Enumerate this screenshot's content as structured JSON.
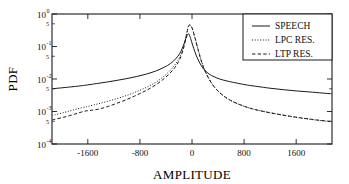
{
  "chart_data": {
    "type": "line",
    "title": "",
    "xlabel": "AMPLITUDE",
    "ylabel": "PDF",
    "yscale": "log",
    "xlim": [
      -2150,
      2150
    ],
    "ylim": [
      0.0001,
      1.0
    ],
    "grid": false,
    "legend_position": "top-right",
    "xticks": [
      -1600,
      -800,
      0,
      800,
      1600
    ],
    "xticklabels": [
      "-1600",
      "-800",
      "0",
      "800",
      "1600"
    ],
    "yticks": [
      1,
      0.5,
      0.1,
      0.05,
      0.01,
      0.005,
      0.001,
      0.0005,
      0.0001
    ],
    "yticklabels": [
      "10^0",
      "5",
      "10^-1",
      "5",
      "10^-2",
      "5",
      "10^-3",
      "5",
      "10^-4"
    ],
    "ytick_majors": [
      {
        "mantissa": "10",
        "exponent": "0",
        "value": 1
      },
      {
        "mantissa": "10",
        "exponent": "-1",
        "value": 0.1
      },
      {
        "mantissa": "10",
        "exponent": "-2",
        "value": 0.01
      },
      {
        "mantissa": "10",
        "exponent": "-3",
        "value": 0.001
      },
      {
        "mantissa": "10",
        "exponent": "-4",
        "value": 0.0001
      }
    ],
    "ytick_minors": [
      {
        "label": "5",
        "value": 0.5
      },
      {
        "label": "5",
        "value": 0.05
      },
      {
        "label": "5",
        "value": 0.005
      },
      {
        "label": "5",
        "value": 0.0005
      }
    ],
    "series": [
      {
        "name": "SPEECH",
        "style": "solid",
        "color": "#1a1a1a",
        "x": [
          -2150,
          -1900,
          -1700,
          -1600,
          -1450,
          -1300,
          -1150,
          -1000,
          -850,
          -700,
          -560,
          -430,
          -330,
          -250,
          -190,
          -150,
          -120,
          -95,
          -75,
          -60,
          -45,
          -20,
          10,
          45,
          80,
          120,
          170,
          230,
          300,
          380,
          470,
          580,
          700,
          850,
          1000,
          1200,
          1400,
          1600,
          1800,
          2000,
          2150
        ],
        "y": [
          0.005,
          0.0056,
          0.0062,
          0.0066,
          0.0073,
          0.0081,
          0.0091,
          0.0103,
          0.0119,
          0.0142,
          0.0175,
          0.0228,
          0.03,
          0.042,
          0.06,
          0.087,
          0.125,
          0.175,
          0.22,
          0.245,
          0.235,
          0.175,
          0.11,
          0.068,
          0.045,
          0.031,
          0.0215,
          0.016,
          0.0128,
          0.0108,
          0.0094,
          0.0083,
          0.0074,
          0.0065,
          0.0059,
          0.0052,
          0.0047,
          0.0043,
          0.004,
          0.0037,
          0.0035
        ]
      },
      {
        "name": "LPC RES.",
        "style": "dotted",
        "color": "#1a1a1a",
        "x": [
          -2150,
          -1950,
          -1800,
          -1700,
          -1620,
          -1560,
          -1450,
          -1320,
          -1180,
          -1050,
          -920,
          -800,
          -680,
          -570,
          -470,
          -380,
          -300,
          -230,
          -180,
          -140,
          -110,
          -85,
          -65,
          -45,
          -20,
          10,
          45,
          85,
          135,
          195,
          270,
          360,
          470,
          600,
          760,
          930,
          1120,
          1320,
          1520,
          1720,
          1920,
          2150
        ],
        "y": [
          0.00075,
          0.00095,
          0.00115,
          0.0013,
          0.0014,
          0.0015,
          0.0017,
          0.002,
          0.0024,
          0.0029,
          0.0036,
          0.0045,
          0.0058,
          0.0076,
          0.0105,
          0.015,
          0.022,
          0.034,
          0.052,
          0.085,
          0.14,
          0.24,
          0.37,
          0.45,
          0.44,
          0.33,
          0.19,
          0.095,
          0.042,
          0.019,
          0.0095,
          0.0052,
          0.0032,
          0.00215,
          0.00155,
          0.0012,
          0.00098,
          0.00082,
          0.0007,
          0.00061,
          0.00054,
          0.00048
        ]
      },
      {
        "name": "LTP RES.",
        "style": "dashed",
        "color": "#1a1a1a",
        "x": [
          -2150,
          -1950,
          -1800,
          -1700,
          -1630,
          -1570,
          -1500,
          -1400,
          -1280,
          -1150,
          -1010,
          -880,
          -760,
          -640,
          -530,
          -430,
          -340,
          -260,
          -200,
          -155,
          -120,
          -92,
          -70,
          -48,
          -22,
          8,
          42,
          82,
          130,
          190,
          265,
          355,
          465,
          595,
          755,
          925,
          1115,
          1315,
          1515,
          1715,
          1915,
          2150
        ],
        "y": [
          0.00055,
          0.00068,
          0.00083,
          0.00096,
          0.00104,
          0.00108,
          0.00112,
          0.00123,
          0.00145,
          0.0018,
          0.0023,
          0.003,
          0.0039,
          0.0052,
          0.0072,
          0.0102,
          0.015,
          0.023,
          0.036,
          0.06,
          0.105,
          0.19,
          0.31,
          0.44,
          0.45,
          0.34,
          0.195,
          0.098,
          0.043,
          0.0195,
          0.0097,
          0.0053,
          0.00325,
          0.00218,
          0.00157,
          0.00121,
          0.00099,
          0.00083,
          0.00071,
          0.00062,
          0.00055,
          0.00049
        ]
      }
    ]
  },
  "legend": {
    "entries": [
      {
        "label": "SPEECH",
        "style": "solid"
      },
      {
        "label": "LPC RES.",
        "style": "dotted"
      },
      {
        "label": "LTP RES.",
        "style": "dashed"
      }
    ]
  }
}
